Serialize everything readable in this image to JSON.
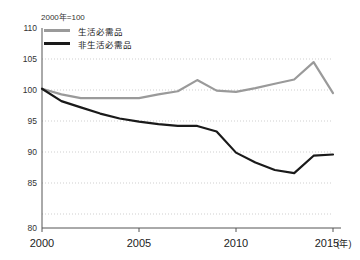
{
  "chart_data": {
    "type": "line",
    "title": "",
    "subtitle": "",
    "annotation": "2000年=100",
    "xlabel": "",
    "ylabel": "",
    "x_unit": "(年)",
    "xlim": [
      2000,
      2015.4
    ],
    "ylim": [
      80,
      110
    ],
    "y_ticks": [
      80,
      85,
      90,
      95,
      100,
      105,
      110
    ],
    "x_ticks": [
      2000,
      2005,
      2010,
      2015
    ],
    "x_tick_labels": [
      "2000",
      "2005",
      "2010",
      "2015"
    ],
    "grid": "horizontal-dotted",
    "legend_position": "top-left-inside",
    "x": [
      2000,
      2001,
      2002,
      2003,
      2004,
      2005,
      2006,
      2007,
      2008,
      2009,
      2010,
      2011,
      2012,
      2013,
      2014,
      2015
    ],
    "series": [
      {
        "name": "生活必需品",
        "color": "#9a9a9a",
        "values": [
          100.2,
          99.3,
          98.7,
          98.7,
          98.7,
          98.7,
          99.3,
          99.8,
          101.6,
          99.9,
          99.7,
          100.3,
          101.0,
          101.7,
          104.5,
          99.5
        ]
      },
      {
        "name": "非生活必需品",
        "color": "#1a1a1a",
        "values": [
          100.2,
          98.2,
          97.2,
          96.2,
          95.4,
          94.9,
          94.5,
          94.2,
          94.2,
          93.3,
          89.9,
          88.3,
          87.1,
          86.6,
          89.4,
          89.6
        ]
      }
    ]
  },
  "legend": {
    "items": [
      {
        "label": "生活必需品"
      },
      {
        "label": "非生活必需品"
      }
    ]
  },
  "axes": {
    "y_labels": [
      "110",
      "105",
      "100",
      "95",
      "90",
      "85",
      "80"
    ],
    "x_labels": [
      "2000",
      "2005",
      "2010",
      "2015"
    ],
    "x_unit_label": "(年)"
  },
  "note": {
    "text": "2000年=100"
  }
}
